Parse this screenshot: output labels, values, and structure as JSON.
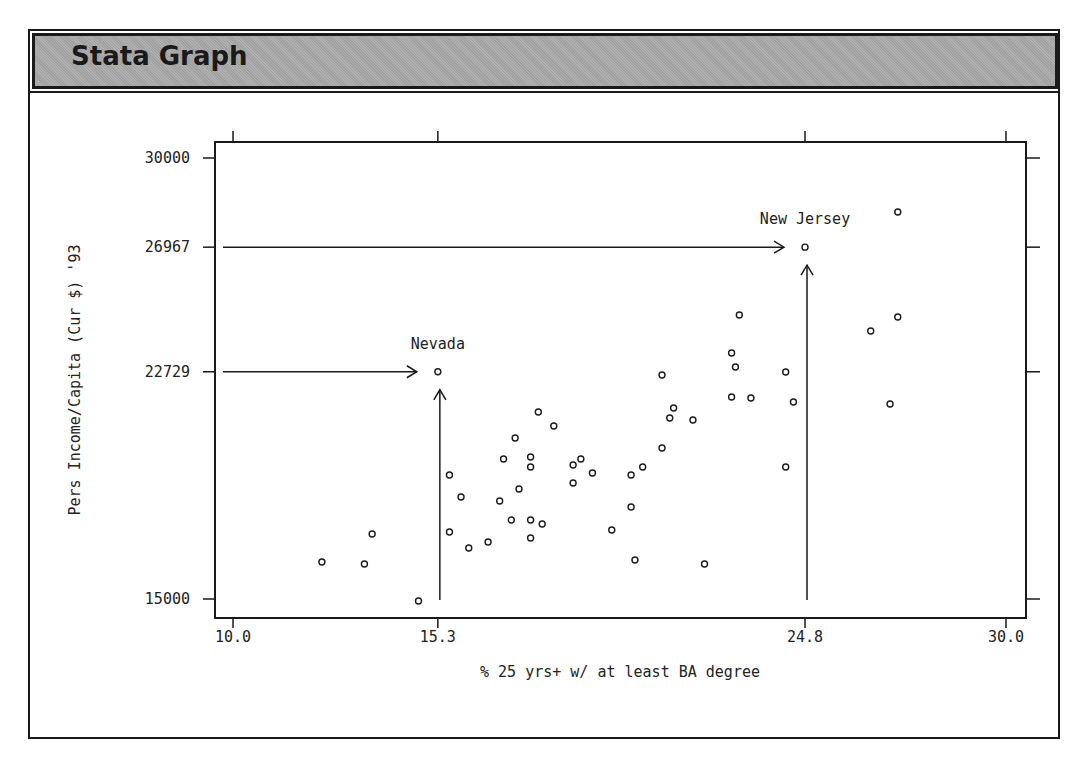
{
  "window": {
    "title": "Stata Graph"
  },
  "chart_data": {
    "type": "scatter",
    "title": "",
    "xlabel": "% 25 yrs+ w/ at least BA degree",
    "ylabel": "Pers Income/Capita (Cur $) '93",
    "xlim": [
      10.0,
      30.0
    ],
    "ylim": [
      15000,
      30000
    ],
    "xticks": [
      10.0,
      15.3,
      24.8,
      30.0
    ],
    "xtick_labels": [
      "10.0",
      "15.3",
      "24.8",
      "30.0"
    ],
    "yticks": [
      15000,
      22729,
      26967,
      30000
    ],
    "ytick_labels": [
      "15000",
      "22729",
      "26967",
      "30000"
    ],
    "grid": false,
    "legend": null,
    "marker": "hollow-circle",
    "points": [
      {
        "x": 12.3,
        "y": 16259
      },
      {
        "x": 13.4,
        "y": 16190
      },
      {
        "x": 13.6,
        "y": 17211
      },
      {
        "x": 14.8,
        "y": 14932
      },
      {
        "x": 15.3,
        "y": 22729,
        "label": "Nevada"
      },
      {
        "x": 15.6,
        "y": 19218
      },
      {
        "x": 15.9,
        "y": 18469
      },
      {
        "x": 15.6,
        "y": 17279
      },
      {
        "x": 16.1,
        "y": 16735
      },
      {
        "x": 16.6,
        "y": 16939
      },
      {
        "x": 16.9,
        "y": 18333
      },
      {
        "x": 17.0,
        "y": 19762
      },
      {
        "x": 17.2,
        "y": 17687
      },
      {
        "x": 17.3,
        "y": 20476
      },
      {
        "x": 17.4,
        "y": 18741
      },
      {
        "x": 17.7,
        "y": 19830
      },
      {
        "x": 17.7,
        "y": 19490
      },
      {
        "x": 17.7,
        "y": 17687
      },
      {
        "x": 18.0,
        "y": 17551
      },
      {
        "x": 17.7,
        "y": 17075
      },
      {
        "x": 17.9,
        "y": 21361
      },
      {
        "x": 18.3,
        "y": 20884
      },
      {
        "x": 18.8,
        "y": 19558
      },
      {
        "x": 19.0,
        "y": 19762
      },
      {
        "x": 19.3,
        "y": 19286
      },
      {
        "x": 18.8,
        "y": 18946
      },
      {
        "x": 19.8,
        "y": 17347
      },
      {
        "x": 20.3,
        "y": 18129
      },
      {
        "x": 20.3,
        "y": 19218
      },
      {
        "x": 20.6,
        "y": 19490
      },
      {
        "x": 20.4,
        "y": 16327
      },
      {
        "x": 21.1,
        "y": 22619
      },
      {
        "x": 21.1,
        "y": 20136
      },
      {
        "x": 21.3,
        "y": 21156
      },
      {
        "x": 21.4,
        "y": 21497
      },
      {
        "x": 21.9,
        "y": 21088
      },
      {
        "x": 22.2,
        "y": 16190
      },
      {
        "x": 22.9,
        "y": 23367
      },
      {
        "x": 23.0,
        "y": 22891
      },
      {
        "x": 22.9,
        "y": 21871
      },
      {
        "x": 23.1,
        "y": 24660
      },
      {
        "x": 23.4,
        "y": 21837
      },
      {
        "x": 24.3,
        "y": 22721
      },
      {
        "x": 24.3,
        "y": 19490
      },
      {
        "x": 24.5,
        "y": 21701
      },
      {
        "x": 24.8,
        "y": 26967,
        "label": "New Jersey"
      },
      {
        "x": 26.5,
        "y": 24116
      },
      {
        "x": 27.0,
        "y": 21633
      },
      {
        "x": 27.2,
        "y": 24592
      },
      {
        "x": 27.2,
        "y": 28163
      }
    ],
    "annotations": [
      {
        "text": "Nevada",
        "x": 15.3,
        "y": 22729,
        "arrows": [
          "from-left-axis",
          "from-bottom-axis"
        ]
      },
      {
        "text": "New Jersey",
        "x": 24.8,
        "y": 26967,
        "arrows": [
          "from-left-axis",
          "from-bottom-axis"
        ]
      }
    ]
  },
  "colors": {
    "titlebar_bg": "#a9a9a9",
    "ink": "#1a1a1a",
    "background": "#ffffff"
  }
}
